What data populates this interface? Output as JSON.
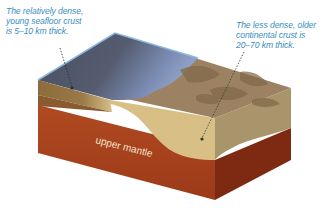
{
  "labels": {
    "oceanic_crust": [
      "The relatively dense,",
      "young seafloor crust",
      "is 5–10 km thick."
    ],
    "continental_crust": [
      "The less dense, older",
      "continental crust is",
      "20–70 km thick."
    ],
    "upper_mantle": "upper mantle"
  },
  "colors": {
    "ocean_top": "#4e5566",
    "ocean_shallow": "#7a8bb0",
    "continent_top": "#9c8262",
    "continent_dark": "#7f6747",
    "continental_crust_side": "#d8bf86",
    "continental_crust_right": "#a8956c",
    "oceanic_crust_side": "#8a6a3a",
    "mantle_front": "#a8421d",
    "mantle_right": "#7e2a12",
    "label_text": "#3a8fbf"
  }
}
